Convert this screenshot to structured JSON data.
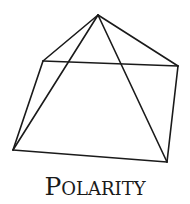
{
  "figure": {
    "type": "pyramid-line-drawing",
    "stroke_color": "#1a1a1a",
    "vertices": {
      "apex": [
        98,
        15
      ],
      "back_left": [
        43,
        61
      ],
      "back_right": [
        178,
        66
      ],
      "front_left": [
        13,
        150
      ],
      "front_right": [
        167,
        162
      ]
    },
    "caption": {
      "first_letter": "P",
      "rest": "OLARITY",
      "full": "POLARITY"
    }
  }
}
